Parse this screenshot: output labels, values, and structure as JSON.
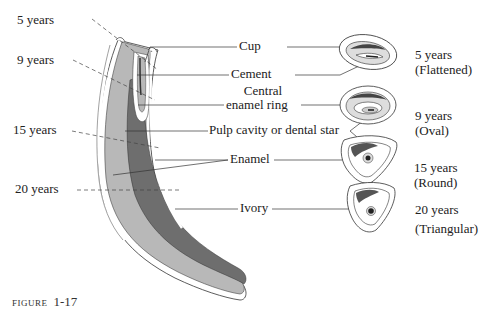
{
  "figure": {
    "caption_word": "FIGURE",
    "caption_number": "1-17"
  },
  "age_marks": [
    {
      "label": "5 years"
    },
    {
      "label": "9 years"
    },
    {
      "label": "15 years"
    },
    {
      "label": "20 years"
    }
  ],
  "parts": {
    "cup": "Cup",
    "cement": "Cement",
    "central_enamel_ring_line1": "Central",
    "central_enamel_ring_line2": "enamel ring",
    "pulp_cavity": "Pulp cavity or dental star",
    "enamel": "Enamel",
    "ivory": "Ivory"
  },
  "cross_sections": [
    {
      "age": "5 years",
      "shape": "(Flattened)"
    },
    {
      "age": "9 years",
      "shape": "(Oval)"
    },
    {
      "age": "15 years",
      "shape": "(Round)"
    },
    {
      "age": "20 years",
      "shape": "(Triangular)"
    }
  ],
  "colors": {
    "ink": "#222222",
    "light_gray": "#b8b8b8",
    "dark_gray": "#6e6e6e",
    "white": "#ffffff"
  }
}
